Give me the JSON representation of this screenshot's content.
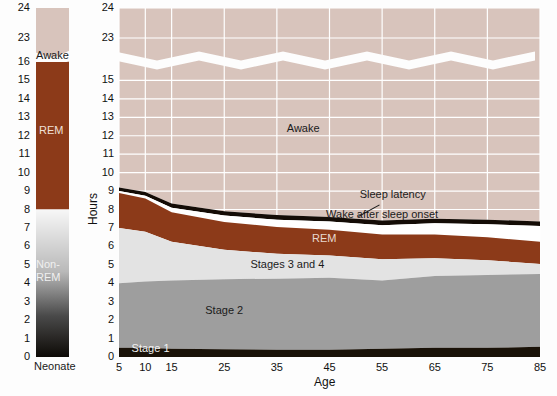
{
  "figure": {
    "background": "#fdfdfd",
    "axis_title_y": "Hours",
    "axis_title_x": "Age",
    "neonate_label": "Neonate"
  },
  "colors": {
    "awake": "#d8c4bc",
    "awake_neonate": "#d8c4bc",
    "rem": "#8c3a19",
    "stage34": "#e3e3e3",
    "stage2": "#9e9e9e",
    "stage1": "#1a1208",
    "wake_after_sleep_onset": "#ffffff",
    "sleep_latency_line": "#140c06",
    "gridline": "#ffffff",
    "text": "#1a1a1a",
    "light_text": "#f2f2f2",
    "background": "#fdfdfd"
  },
  "neonate_bar": {
    "label": "Neonate",
    "segments": [
      {
        "name": "Awake",
        "label": "Awake",
        "from": 16,
        "to": 24,
        "color": "#d8c4bc"
      },
      {
        "name": "REM",
        "label": "REM",
        "from": 8,
        "to": 16,
        "color": "#8c3a19"
      },
      {
        "name": "Non-REM",
        "label": "Non-\nREM",
        "label_line1": "Non-",
        "label_line2": "REM",
        "from": 0,
        "to": 8,
        "color": "gradient-white-to-black"
      }
    ],
    "ticks": [
      0,
      1,
      2,
      3,
      4,
      5,
      6,
      7,
      8,
      9,
      10,
      11,
      12,
      13,
      14,
      15,
      16,
      23,
      24
    ]
  },
  "chart_data": {
    "type": "area",
    "title": "",
    "subtitle": "",
    "xlabel": "Age",
    "ylabel": "Hours",
    "xlim": [
      5,
      85
    ],
    "ylim": [
      0,
      24
    ],
    "y_axis_break": {
      "from": 16,
      "to": 22.6,
      "style": "zigzag"
    },
    "grid": true,
    "grid_axis": "both",
    "legend_position": "inline-annotations",
    "x": [
      5,
      10,
      15,
      25,
      35,
      45,
      55,
      65,
      75,
      85
    ],
    "xticks": [
      5,
      10,
      15,
      25,
      35,
      45,
      55,
      65,
      75,
      85
    ],
    "yticks": [
      0,
      1,
      2,
      3,
      4,
      5,
      6,
      7,
      8,
      9,
      10,
      11,
      12,
      13,
      14,
      15,
      23,
      24
    ],
    "stacking": "stacked-from-zero",
    "series": [
      {
        "name": "Stage 1",
        "label": "Stage 1",
        "color": "#1a1208",
        "values": [
          0.5,
          0.5,
          0.45,
          0.42,
          0.4,
          0.4,
          0.45,
          0.5,
          0.5,
          0.55
        ]
      },
      {
        "name": "Stage 2",
        "label": "Stage 2",
        "color": "#9e9e9e",
        "values": [
          3.5,
          3.6,
          3.7,
          3.8,
          3.85,
          3.9,
          3.7,
          3.9,
          3.95,
          3.95
        ]
      },
      {
        "name": "Stages 3 and 4",
        "label": "Stages 3 and 4",
        "color": "#e3e3e3",
        "values": [
          3.0,
          2.7,
          2.1,
          1.6,
          1.35,
          1.2,
          1.15,
          0.95,
          0.8,
          0.55
        ]
      },
      {
        "name": "REM",
        "label": "REM",
        "color": "#8c3a19",
        "values": [
          1.9,
          1.8,
          1.6,
          1.5,
          1.45,
          1.4,
          1.35,
          1.3,
          1.25,
          1.2
        ]
      },
      {
        "name": "Wake after sleep onset",
        "label": "Wake after sleep onset",
        "color": "#ffffff",
        "values": [
          0.1,
          0.15,
          0.25,
          0.35,
          0.4,
          0.45,
          0.5,
          0.6,
          0.7,
          0.85
        ]
      },
      {
        "name": "Sleep latency",
        "label": "Sleep latency",
        "color": "#140c06",
        "values": [
          0.2,
          0.2,
          0.22,
          0.23,
          0.25,
          0.25,
          0.25,
          0.25,
          0.25,
          0.25
        ]
      },
      {
        "name": "Awake",
        "label": "Awake",
        "color": "#d8c4bc",
        "values": [
          14.8,
          15.05,
          15.68,
          16.0,
          16.3,
          16.4,
          16.6,
          16.5,
          16.55,
          16.65
        ]
      }
    ],
    "cumulative_tops": {
      "stage1": [
        0.5,
        0.5,
        0.45,
        0.42,
        0.4,
        0.4,
        0.45,
        0.5,
        0.5,
        0.55
      ],
      "stage2": [
        4.0,
        4.1,
        4.15,
        4.22,
        4.25,
        4.3,
        4.15,
        4.4,
        4.45,
        4.5
      ],
      "stage34": [
        7.0,
        6.8,
        6.25,
        5.82,
        5.6,
        5.5,
        5.3,
        5.35,
        5.25,
        5.05
      ],
      "rem": [
        8.9,
        8.6,
        7.85,
        7.32,
        7.05,
        6.9,
        6.65,
        6.65,
        6.5,
        6.25
      ],
      "waso": [
        9.0,
        8.75,
        8.1,
        7.67,
        7.45,
        7.35,
        7.15,
        7.25,
        7.2,
        7.1
      ],
      "sleep_latency": [
        9.2,
        8.95,
        8.32,
        7.9,
        7.7,
        7.6,
        7.4,
        7.5,
        7.45,
        7.35
      ],
      "awake_top": [
        24,
        24,
        24,
        24,
        24,
        24,
        24,
        24,
        24,
        24
      ]
    },
    "annotations": [
      {
        "text": "Awake",
        "x": 40,
        "y": 12.2,
        "color": "#1b1b1b"
      },
      {
        "text": "Sleep latency",
        "x": 57,
        "y": 8.6,
        "color": "#1b1b1b",
        "leader": true
      },
      {
        "text": "Wake after sleep onset",
        "x": 55,
        "y": 7.55,
        "color": "#1b1b1b"
      },
      {
        "text": "REM",
        "x": 44,
        "y": 6.25,
        "color": "#e8d8d0"
      },
      {
        "text": "Stages 3 and 4",
        "x": 37,
        "y": 4.85,
        "color": "#1b1b1b"
      },
      {
        "text": "Stage 2",
        "x": 25,
        "y": 2.35,
        "color": "#1b1b1b"
      },
      {
        "text": "Stage 1",
        "x": 11,
        "y": 0.25,
        "color": "#f2f2f2"
      }
    ]
  }
}
